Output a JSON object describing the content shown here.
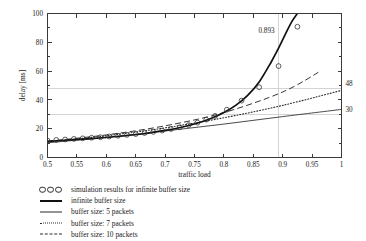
{
  "chart_data": {
    "type": "line",
    "title": "",
    "xlabel": "traffic load",
    "ylabel": "delay [ms]",
    "xlim": [
      0.5,
      1.0
    ],
    "ylim": [
      0,
      100
    ],
    "grid": true,
    "legend_position": "below-plot",
    "xticks": [
      "0.5",
      "0.55",
      "0.6",
      "0.65",
      "0.7",
      "0.75",
      "0.8",
      "0.85",
      "0.9",
      "0.95",
      "1"
    ],
    "xtick_values": [
      0.5,
      0.55,
      0.6,
      0.65,
      0.7,
      0.75,
      0.8,
      0.85,
      0.9,
      0.95,
      1.0
    ],
    "yticks": [
      "0",
      "20",
      "40",
      "60",
      "80",
      "100"
    ],
    "ytick_values": [
      0,
      20,
      40,
      60,
      80,
      100
    ],
    "annotations": [
      {
        "text": "0.893",
        "kind": "vertical-gridline-label",
        "x": 0.893
      },
      {
        "text": "48",
        "kind": "horizontal-gridline-label",
        "y": 48
      },
      {
        "text": "30",
        "kind": "horizontal-gridline-label",
        "y": 30
      }
    ],
    "reference_lines": {
      "vertical": [
        0.893
      ],
      "horizontal": [
        48,
        30
      ]
    },
    "series": [
      {
        "name": "simulation results for infinite buffer size",
        "style": "circle-markers",
        "x": [
          0.5,
          0.515,
          0.53,
          0.545,
          0.56,
          0.575,
          0.59,
          0.605,
          0.62,
          0.635,
          0.65,
          0.665,
          0.68,
          0.695,
          0.71,
          0.725,
          0.74,
          0.755,
          0.77,
          0.785,
          0.805,
          0.83,
          0.86,
          0.893,
          0.925
        ],
        "values": [
          11.8,
          12.2,
          12.5,
          12.9,
          13.3,
          13.7,
          14.1,
          14.6,
          15.1,
          15.7,
          16.3,
          17.0,
          17.8,
          18.7,
          19.8,
          21.0,
          22.5,
          24.2,
          26.3,
          28.9,
          33.2,
          39.5,
          48.8,
          63.5,
          90.8
        ]
      },
      {
        "name": "infinite buffer size",
        "style": "solid-thick",
        "x": [
          0.5,
          0.54,
          0.58,
          0.62,
          0.66,
          0.7,
          0.73,
          0.76,
          0.78,
          0.8,
          0.82,
          0.84,
          0.86,
          0.88,
          0.893,
          0.905,
          0.915,
          0.925,
          0.932
        ],
        "values": [
          11.2,
          12.2,
          13.3,
          14.6,
          16.3,
          18.8,
          21.2,
          24.5,
          27.4,
          31.2,
          36.2,
          43.0,
          52.5,
          66.0,
          76.0,
          86.0,
          94.0,
          100.0,
          104.0
        ]
      },
      {
        "name": "buffer size: 5 packets",
        "style": "solid-thin",
        "x": [
          0.5,
          0.6,
          0.7,
          0.8,
          0.9,
          1.0
        ],
        "values": [
          10.2,
          14.0,
          18.4,
          23.2,
          28.4,
          33.4
        ]
      },
      {
        "name": "buffer size: 7 packets",
        "style": "dotted",
        "x": [
          0.5,
          0.6,
          0.7,
          0.8,
          0.9,
          1.0
        ],
        "values": [
          11.0,
          15.1,
          20.6,
          27.6,
          36.2,
          46.6
        ]
      },
      {
        "name": "buffer size: 10 packets",
        "style": "dashed",
        "x": [
          0.5,
          0.6,
          0.7,
          0.8,
          0.9,
          0.965
        ],
        "values": [
          11.3,
          15.7,
          22.0,
          31.2,
          45.5,
          60.2
        ]
      }
    ]
  },
  "legend": {
    "items": [
      {
        "key": "circles",
        "label": "simulation results for infinite buffer size"
      },
      {
        "key": "solid-thick",
        "label": "infinite buffer size"
      },
      {
        "key": "solid-thin",
        "label": "buffer size: 5 packets"
      },
      {
        "key": "dotted",
        "label": "buffer size: 7 packets"
      },
      {
        "key": "dashed",
        "label": "buffer size: 10 packets"
      }
    ]
  }
}
